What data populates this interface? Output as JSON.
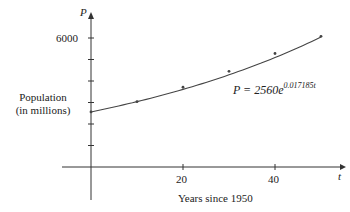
{
  "chart_data": {
    "type": "scatter",
    "title": "",
    "xlabel": "Years since 1950",
    "ylabel": "Population (in millions)",
    "x_axis_symbol": "t",
    "y_axis_symbol": "P",
    "xlim": [
      0,
      55
    ],
    "ylim": [
      0,
      6500
    ],
    "x_ticks": [
      20,
      40
    ],
    "x_tick_labels": [
      "20",
      "40"
    ],
    "y_ticks": [
      1000,
      2000,
      3000,
      4000,
      5000,
      6000
    ],
    "y_tick_labels_shown": [
      "6000"
    ],
    "grid": false,
    "series": [
      {
        "name": "Observed population",
        "kind": "points",
        "x": [
          0,
          10,
          20,
          30,
          40,
          50
        ],
        "y": [
          2560,
          3040,
          3710,
          4450,
          5280,
          6080
        ]
      },
      {
        "name": "Exponential model",
        "kind": "curve",
        "formula": "P = 2560e^(0.017185t)",
        "a": 2560,
        "k": 0.017185,
        "x_range": [
          0,
          50
        ]
      }
    ],
    "annotations": [
      {
        "text": "P = 2560e^(0.017185t)",
        "near": "curve, t≈35"
      }
    ]
  },
  "labels": {
    "y_axis_symbol": "P",
    "x_axis_symbol": "t",
    "ylabel_line1": "Population",
    "ylabel_line2": "(in millions)",
    "xlabel": "Years since 1950",
    "ytick_6000": "6000",
    "xtick_20": "20",
    "xtick_40": "40",
    "equation_base": "P = 2560e",
    "equation_exponent": "0.017185t"
  },
  "colors": {
    "axis": "#333333",
    "curve": "#444444",
    "points": "#444444"
  }
}
